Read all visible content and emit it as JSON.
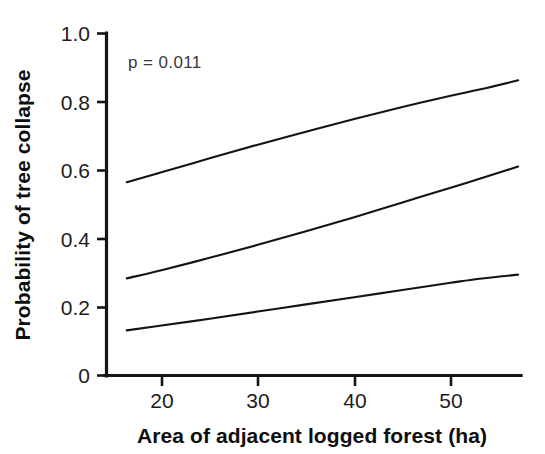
{
  "chart_data": {
    "type": "line",
    "title": "",
    "xlabel": "Area of adjacent logged forest (ha)",
    "ylabel": "Probability of tree collapse",
    "xlim": [
      14.3,
      57.3
    ],
    "ylim": [
      0,
      1
    ],
    "grid": false,
    "legend": "none",
    "annotations": [
      {
        "name": "p-value",
        "text": "p = 0.011",
        "x": 18.0,
        "y": 0.925
      }
    ],
    "xticks": [
      20,
      30,
      40,
      50
    ],
    "xtick_labels": [
      "20",
      "30",
      "40",
      "50"
    ],
    "yticks": [
      0,
      0.2,
      0.4,
      0.6,
      0.8,
      1.0
    ],
    "ytick_labels": [
      "0",
      "0.2",
      "0.4",
      "0.6",
      "0.8",
      "1.0"
    ],
    "x": [
      16.4,
      20,
      25,
      30,
      35,
      40,
      45,
      50,
      53,
      57.0
    ],
    "series": [
      {
        "name": "upper-confidence-limit",
        "values": [
          0.565,
          0.594,
          0.635,
          0.675,
          0.713,
          0.75,
          0.785,
          0.818,
          0.836,
          0.863
        ]
      },
      {
        "name": "fitted-probability",
        "values": [
          0.284,
          0.308,
          0.344,
          0.382,
          0.422,
          0.463,
          0.506,
          0.549,
          0.575,
          0.611
        ]
      },
      {
        "name": "lower-confidence-limit",
        "values": [
          0.132,
          0.146,
          0.166,
          0.187,
          0.208,
          0.229,
          0.25,
          0.271,
          0.283,
          0.295
        ]
      }
    ]
  },
  "figure": {
    "background_color": "#ffffff",
    "line_color": "#141414",
    "axis_color": "#141414",
    "annotation_color": "#3a3a3a"
  }
}
